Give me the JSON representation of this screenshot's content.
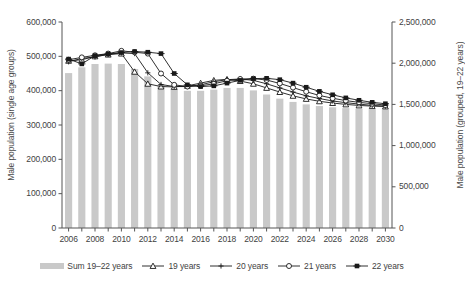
{
  "chart_data": {
    "type": "line",
    "title": "",
    "xlabel": "",
    "ylabel": "Male population (single age groups)",
    "y2label": "Male population (grouped, 19–22 years)",
    "grid": false,
    "legend_position": "bottom",
    "x": [
      2006,
      2007,
      2008,
      2009,
      2010,
      2011,
      2012,
      2013,
      2014,
      2015,
      2016,
      2017,
      2018,
      2019,
      2020,
      2021,
      2022,
      2023,
      2024,
      2025,
      2026,
      2027,
      2028,
      2029,
      2030
    ],
    "xtick_labels": [
      "2006",
      "2008",
      "2010",
      "2012",
      "2014",
      "2016",
      "2018",
      "2020",
      "2022",
      "2024",
      "2026",
      "2028",
      "2030"
    ],
    "ylim": [
      0,
      600000
    ],
    "ytick_labels": [
      "0",
      "100,000",
      "200,000",
      "300,000",
      "400,000",
      "500,000",
      "600,000"
    ],
    "ytick_values": [
      0,
      100000,
      200000,
      300000,
      400000,
      500000,
      600000
    ],
    "y2lim": [
      0,
      2500000
    ],
    "y2tick_labels": [
      "0",
      "500,000",
      "1,000,000",
      "1,500,000",
      "2,000,000",
      "2,500,000"
    ],
    "y2tick_values": [
      0,
      500000,
      1000000,
      1500000,
      2000000,
      2500000
    ],
    "bar_series": {
      "name": "Sum 19–22 years",
      "axis": "right",
      "color": "#c9c9c9",
      "values": [
        1880000,
        1950000,
        1990000,
        1995000,
        1990000,
        1930000,
        1840000,
        1740000,
        1690000,
        1665000,
        1665000,
        1680000,
        1700000,
        1700000,
        1670000,
        1620000,
        1570000,
        1530000,
        1500000,
        1480000,
        1465000,
        1455000,
        1448000,
        1442000,
        1440000
      ]
    },
    "series": [
      {
        "name": "19 years",
        "marker": "open-triangle",
        "axis": "left",
        "values": [
          487000,
          490000,
          500000,
          505000,
          508000,
          455000,
          420000,
          412000,
          411000,
          414000,
          422000,
          430000,
          433000,
          428000,
          420000,
          408000,
          396000,
          385000,
          376000,
          369000,
          364000,
          360000,
          357000,
          355000,
          354000
        ]
      },
      {
        "name": "20 years",
        "marker": "plus",
        "axis": "left",
        "values": [
          484000,
          494000,
          498000,
          506000,
          510000,
          508000,
          452000,
          418000,
          412000,
          412000,
          417000,
          426000,
          432000,
          434000,
          430000,
          420000,
          408000,
          396000,
          385000,
          377000,
          370000,
          365000,
          361000,
          357000,
          355000
        ]
      },
      {
        "name": "21 years",
        "marker": "open-circle",
        "axis": "left",
        "values": [
          490000,
          497000,
          503000,
          508000,
          516000,
          512000,
          508000,
          450000,
          417000,
          412000,
          414000,
          420000,
          429000,
          434000,
          435000,
          431000,
          421000,
          409000,
          397000,
          386000,
          378000,
          371000,
          366000,
          362000,
          358000
        ]
      },
      {
        "name": "22 years",
        "marker": "filled-square",
        "axis": "left",
        "values": [
          492000,
          478000,
          502000,
          507000,
          511000,
          514000,
          512000,
          508000,
          450000,
          417000,
          412000,
          414000,
          422000,
          430000,
          435000,
          436000,
          432000,
          422000,
          410000,
          398000,
          388000,
          379000,
          372000,
          366000,
          362000
        ]
      }
    ]
  },
  "legend": {
    "items": [
      {
        "label": "Sum 19–22 years",
        "marker": "bar"
      },
      {
        "label": "19 years",
        "marker": "open-triangle"
      },
      {
        "label": "20 years",
        "marker": "plus"
      },
      {
        "label": "21 years",
        "marker": "open-circle"
      },
      {
        "label": "22 years",
        "marker": "filled-square"
      }
    ]
  }
}
